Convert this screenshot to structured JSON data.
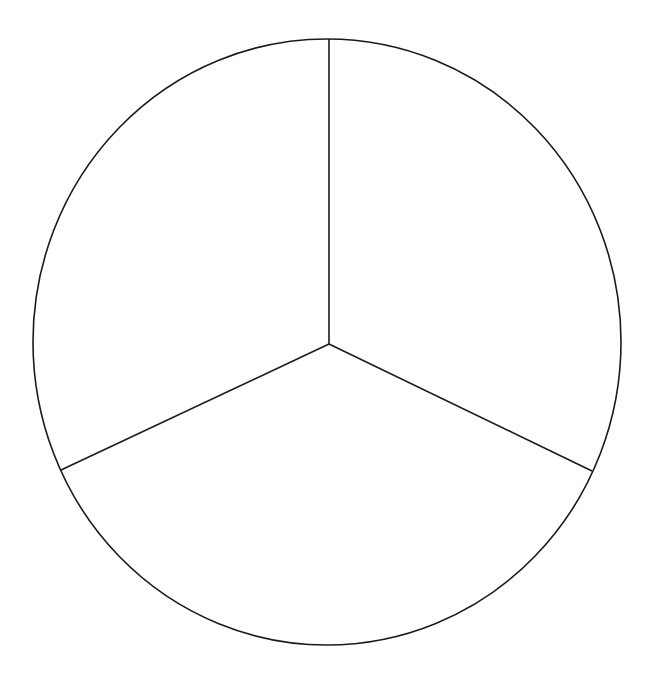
{
  "diagram": {
    "type": "circle-divided-into-three-sections",
    "sections": 3,
    "stroke_color": "#1a1a1a",
    "fill_color": "#ffffff",
    "background": "#ffffff",
    "ellipse": {
      "cx": 327,
      "cy": 342,
      "rx": 294,
      "ry": 303
    },
    "center": {
      "x": 329,
      "y": 344
    },
    "spokes": [
      {
        "name": "top",
        "x2": 329,
        "y2": 39
      },
      {
        "name": "bottom-left",
        "x2": 61,
        "y2": 470
      },
      {
        "name": "bottom-right",
        "x2": 592,
        "y2": 471
      }
    ]
  }
}
